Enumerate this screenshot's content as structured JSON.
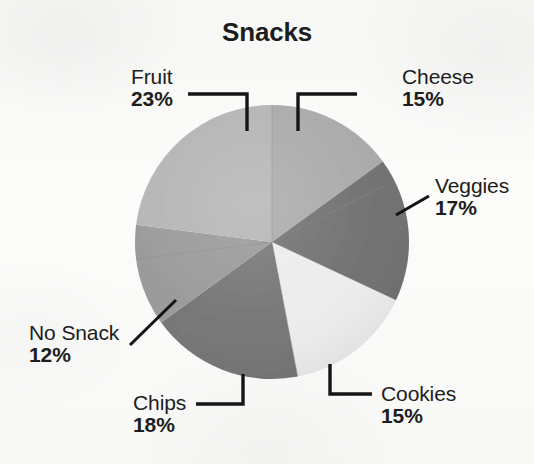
{
  "chart_data": {
    "type": "pie",
    "title": "Snacks",
    "unit": "%",
    "total": 100,
    "categories": [
      "Cheese",
      "Veggies",
      "Cookies",
      "Chips",
      "No Snack",
      "Fruit"
    ],
    "values": [
      15,
      17,
      15,
      18,
      12,
      23
    ],
    "labels": [
      "15%",
      "17%",
      "15%",
      "18%",
      "12%",
      "23%"
    ],
    "colors": [
      "#a9a9a9",
      "#6f6f6f",
      "#ececec",
      "#747474",
      "#989898",
      "#b4b4b4"
    ],
    "start_angle_deg": 0,
    "direction": "clockwise",
    "legend": "none",
    "grid": false,
    "slices": [
      {
        "name": "Cheese",
        "value": 15,
        "label": "15%",
        "color": "#a9a9a9",
        "callout_position": "top-right"
      },
      {
        "name": "Veggies",
        "value": 17,
        "label": "17%",
        "color": "#6f6f6f",
        "callout_position": "right"
      },
      {
        "name": "Cookies",
        "value": 15,
        "label": "15%",
        "color": "#ececec",
        "callout_position": "bottom-right"
      },
      {
        "name": "Chips",
        "value": 18,
        "label": "18%",
        "color": "#747474",
        "callout_position": "bottom-left"
      },
      {
        "name": "No Snack",
        "value": 12,
        "label": "12%",
        "color": "#989898",
        "callout_position": "left"
      },
      {
        "name": "Fruit",
        "value": 23,
        "label": "23%",
        "color": "#b4b4b4",
        "callout_position": "top-left"
      }
    ]
  },
  "chart": {
    "title": "Snacks",
    "callouts": {
      "fruit": {
        "category": "Fruit",
        "percent": "23%"
      },
      "cheese": {
        "category": "Cheese",
        "percent": "15%"
      },
      "veggies": {
        "category": "Veggies",
        "percent": "17%"
      },
      "cookies": {
        "category": "Cookies",
        "percent": "15%"
      },
      "chips": {
        "category": "Chips",
        "percent": "18%"
      },
      "no_snack": {
        "category": "No Snack",
        "percent": "12%"
      }
    },
    "colors": {
      "text": "#1d1d1d",
      "leader_line": "#151515",
      "background": "#fbfbfa"
    }
  }
}
